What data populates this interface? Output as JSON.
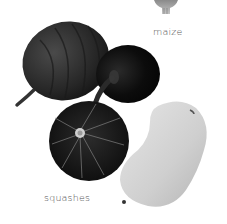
{
  "image": {
    "description": "Grayscale photograph of squashes with a partial maize cob at top",
    "style": "grayscale"
  },
  "labels": {
    "maize": "maize",
    "squashes": "squashes"
  },
  "objects": [
    {
      "name": "acorn-squash",
      "tone": "#2b2b2b"
    },
    {
      "name": "round-dark-squash",
      "tone": "#111111"
    },
    {
      "name": "kabocha-squash",
      "tone": "#1a1a1a"
    },
    {
      "name": "butternut-squash",
      "tone": "#d8d8d8"
    },
    {
      "name": "maize-cob-fragment",
      "tone": "#9a9a9a"
    }
  ]
}
